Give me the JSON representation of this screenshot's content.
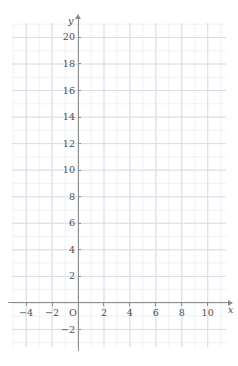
{
  "chart_data": {
    "type": "scatter",
    "title": "",
    "subtitle": "",
    "xlabel": "x",
    "ylabel": "y",
    "origin_label": "O",
    "grid": true,
    "legend": null,
    "annotations": [],
    "series": [],
    "x": [],
    "values": [],
    "xlim": [
      -5.0,
      11.5
    ],
    "ylim": [
      -3.2,
      21.2
    ],
    "x_major_step": 2,
    "y_major_step": 2,
    "x_minor_step": 1,
    "y_minor_step": 1,
    "x_ticks": [
      -4,
      -2,
      2,
      4,
      6,
      8,
      10
    ],
    "y_ticks": [
      -2,
      2,
      4,
      6,
      8,
      10,
      12,
      14,
      16,
      18,
      20
    ],
    "x_tick_labels": [
      "−4",
      "−2",
      "2",
      "4",
      "6",
      "8",
      "10"
    ],
    "y_tick_labels": [
      "−2",
      "2",
      "4",
      "6",
      "8",
      "10",
      "12",
      "14",
      "16",
      "18",
      "20"
    ],
    "colors": {
      "background": "#ffffff",
      "axis": "#8c8c8c",
      "grid_major": "#d8dde6",
      "grid_minor": "#edf0f5",
      "label": "#4c4c4c"
    }
  },
  "axes": {
    "x_name": "x",
    "y_name": "y",
    "origin": "O"
  }
}
